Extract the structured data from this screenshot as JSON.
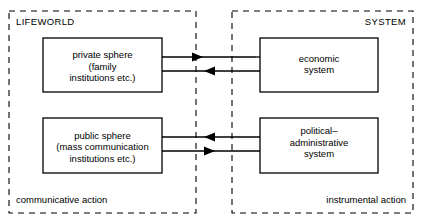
{
  "diagram": {
    "colors": {
      "background": "#ffffff",
      "stroke": "#000000",
      "box_fill": "#ffffff"
    },
    "panels": [
      {
        "id": "lifeworld",
        "label": "LIFEWORLD",
        "footer_label": "communicative action",
        "label_position": "top-left",
        "footer_position": "bottom-left",
        "border_style": "dashed"
      },
      {
        "id": "system",
        "label": "SYSTEM",
        "footer_label": "instrumental action",
        "label_position": "top-right",
        "footer_position": "bottom-right",
        "border_style": "dashed"
      }
    ],
    "boxes": [
      {
        "id": "private-sphere",
        "panel": "lifeworld",
        "lines": [
          "private sphere",
          "(family",
          "institutions etc.)"
        ]
      },
      {
        "id": "economic-system",
        "panel": "system",
        "lines": [
          "economic",
          "system"
        ]
      },
      {
        "id": "public-sphere",
        "panel": "lifeworld",
        "lines": [
          "public sphere",
          "(mass communication",
          "institutions etc.)"
        ]
      },
      {
        "id": "political-administrative-system",
        "panel": "system",
        "lines": [
          "political–",
          "administrative",
          "system"
        ]
      }
    ],
    "connectors": [
      {
        "id": "private-to-economic",
        "from": "private-sphere",
        "to": "economic-system",
        "direction": "right"
      },
      {
        "id": "economic-to-private",
        "from": "economic-system",
        "to": "private-sphere",
        "direction": "left"
      },
      {
        "id": "political-to-public",
        "from": "political-administrative-system",
        "to": "public-sphere",
        "direction": "left"
      },
      {
        "id": "public-to-political",
        "from": "public-sphere",
        "to": "political-administrative-system",
        "direction": "right"
      }
    ]
  }
}
